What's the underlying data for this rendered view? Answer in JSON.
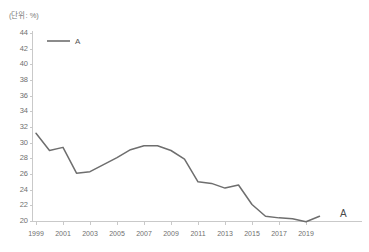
{
  "chart_title": "",
  "unit_label": "(단위: %)",
  "legend": {
    "entries": [
      {
        "name": "A",
        "color": "#6e6e6e"
      }
    ],
    "position": "top-left"
  },
  "endpoint_annotation": "A",
  "chart_data": {
    "type": "line",
    "title": "",
    "xlabel": "",
    "ylabel": "",
    "unit": "%",
    "grid": false,
    "legend_position": "top-left",
    "ylim": [
      20,
      44
    ],
    "ytick_step": 2,
    "ytick_labels": [
      "20",
      "22",
      "24",
      "26",
      "28",
      "30",
      "32",
      "34",
      "36",
      "38",
      "40",
      "42",
      "44"
    ],
    "xlim": [
      1999,
      2020
    ],
    "xtick_labels": [
      "1999",
      "2001",
      "2003",
      "2005",
      "2007",
      "2009",
      "2011",
      "2013",
      "2015",
      "2017",
      "2019"
    ],
    "x": [
      1999,
      2000,
      2001,
      2002,
      2003,
      2004,
      2005,
      2006,
      2007,
      2008,
      2009,
      2010,
      2011,
      2012,
      2013,
      2014,
      2015,
      2016,
      2017,
      2018,
      2019,
      2020
    ],
    "series": [
      {
        "name": "A",
        "color": "#6e6e6e",
        "values": [
          31.2,
          29.0,
          29.4,
          26.1,
          26.3,
          27.2,
          28.1,
          29.1,
          29.6,
          29.6,
          29.0,
          27.9,
          25.0,
          24.8,
          24.2,
          24.6,
          22.1,
          20.6,
          20.4,
          20.3,
          19.9,
          20.6
        ]
      }
    ]
  }
}
